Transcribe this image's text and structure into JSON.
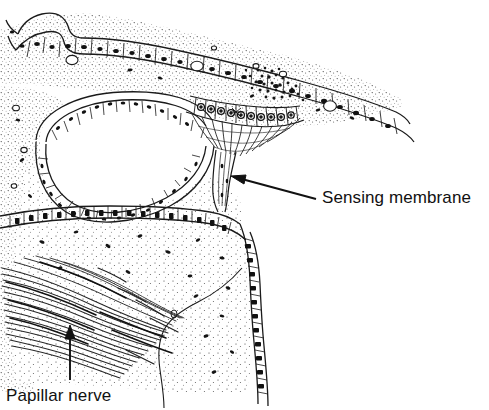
{
  "figure": {
    "kind": "histological-section-diagram",
    "width": 489,
    "height": 410,
    "background_color": "#ffffff",
    "ink_color": "#1a1a1a"
  },
  "labels": {
    "sensing_membrane": "Sensing membrane",
    "papillar_nerve": "Papillar nerve"
  },
  "annotations": [
    {
      "name": "sensing-membrane-leader",
      "text": "Sensing membrane",
      "arrow_tip_x": 232,
      "arrow_tip_y": 176,
      "arrow_tail_x": 316,
      "arrow_tail_y": 199,
      "direction": "up-left"
    },
    {
      "name": "papillar-nerve-leader",
      "text": "Papillar nerve",
      "arrow_tip_x": 70,
      "arrow_tip_y": 327,
      "arrow_tail_x": 70,
      "arrow_tail_y": 380,
      "direction": "up"
    }
  ],
  "structures": [
    {
      "name": "outer-epithelium",
      "description": "upper epithelial cell layer with rectangular cells and dark nuclei"
    },
    {
      "name": "connective-tissue-matrix",
      "description": "stippled ground substance with scattered dark nuclei"
    },
    {
      "name": "central-cavity",
      "description": "large empty lumen in left-center"
    },
    {
      "name": "sensory-epithelium",
      "description": "columnar sensory cells converging centrally"
    },
    {
      "name": "nerve-stalk",
      "description": "narrow fibre stalk descending from sensory epithelium"
    },
    {
      "name": "papillar-nerve-bundle",
      "description": "bundle of diagonal nerve fibres at lower left"
    },
    {
      "name": "basement-border",
      "description": "cellular boundary descending at right"
    }
  ]
}
